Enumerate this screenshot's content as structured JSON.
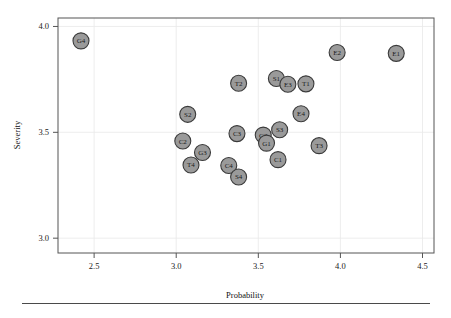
{
  "chart_data": {
    "type": "scatter",
    "title": "",
    "xlabel": "Probability",
    "ylabel": "Severity",
    "xlim": [
      2.28,
      4.57
    ],
    "ylim": [
      2.93,
      4.04
    ],
    "xticks": [
      "2.5",
      "3.0",
      "3.5",
      "4.0",
      "4.5"
    ],
    "xtick_values": [
      2.5,
      3.0,
      3.5,
      4.0,
      4.5
    ],
    "yticks": [
      "3.0",
      "3.5",
      "4.0"
    ],
    "ytick_values": [
      3.0,
      3.5,
      4.0
    ],
    "grid": true,
    "legend": "none",
    "marker_fill": "#9a9a9a",
    "marker_stroke": "#3a3a3a",
    "points": [
      {
        "label": "G4",
        "x": 2.42,
        "y": 3.932
      },
      {
        "label": "E2",
        "x": 3.98,
        "y": 3.877
      },
      {
        "label": "E1",
        "x": 4.34,
        "y": 3.873
      },
      {
        "label": "S1",
        "x": 3.61,
        "y": 3.754
      },
      {
        "label": "E3",
        "x": 3.68,
        "y": 3.727
      },
      {
        "label": "T1",
        "x": 3.79,
        "y": 3.729
      },
      {
        "label": "T2",
        "x": 3.38,
        "y": 3.732
      },
      {
        "label": "S2",
        "x": 3.07,
        "y": 3.585
      },
      {
        "label": "E4",
        "x": 3.76,
        "y": 3.588
      },
      {
        "label": "C3",
        "x": 3.37,
        "y": 3.494
      },
      {
        "label": "S3",
        "x": 3.63,
        "y": 3.512
      },
      {
        "label": "G2",
        "x": 3.53,
        "y": 3.487
      },
      {
        "label": "G1",
        "x": 3.55,
        "y": 3.449
      },
      {
        "label": "C2",
        "x": 3.04,
        "y": 3.459
      },
      {
        "label": "T3",
        "x": 3.87,
        "y": 3.437
      },
      {
        "label": "G3",
        "x": 3.16,
        "y": 3.405
      },
      {
        "label": "C1",
        "x": 3.62,
        "y": 3.371
      },
      {
        "label": "T4",
        "x": 3.09,
        "y": 3.346
      },
      {
        "label": "C4",
        "x": 3.32,
        "y": 3.343
      },
      {
        "label": "S4",
        "x": 3.38,
        "y": 3.289
      }
    ]
  }
}
